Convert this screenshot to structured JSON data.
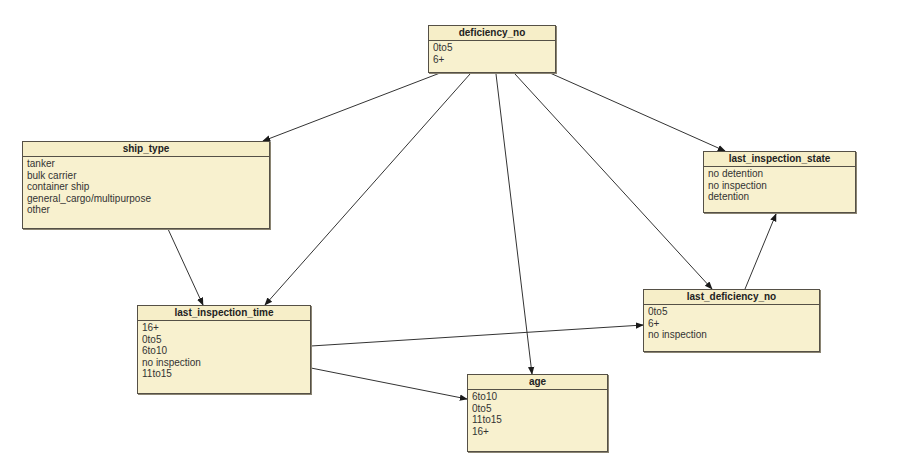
{
  "diagram": {
    "type": "bayesian-network",
    "nodes": [
      {
        "id": "deficiency_no",
        "label": "deficiency_no",
        "states": [
          "0to5",
          "6+"
        ],
        "box": {
          "x": 428,
          "y": 25,
          "w": 128,
          "h": 48
        }
      },
      {
        "id": "ship_type",
        "label": "ship_type",
        "states": [
          "tanker",
          "bulk carrier",
          "container ship",
          "general_cargo/multipurpose",
          "other"
        ],
        "box": {
          "x": 22,
          "y": 141,
          "w": 248,
          "h": 88
        }
      },
      {
        "id": "last_inspection_state",
        "label": "last_inspection_state",
        "states": [
          "no detention",
          "no inspection",
          "detention"
        ],
        "box": {
          "x": 703,
          "y": 151,
          "w": 153,
          "h": 62
        }
      },
      {
        "id": "last_inspection_time",
        "label": "last_inspection_time",
        "states": [
          "16+",
          "0to5",
          "6to10",
          "no inspection",
          "11to15"
        ],
        "box": {
          "x": 137,
          "y": 305,
          "w": 174,
          "h": 89
        }
      },
      {
        "id": "last_deficiency_no",
        "label": "last_deficiency_no",
        "states": [
          "0to5",
          "6+",
          "no inspection"
        ],
        "box": {
          "x": 643,
          "y": 289,
          "w": 177,
          "h": 63
        }
      },
      {
        "id": "age",
        "label": "age",
        "states": [
          "6to10",
          "0to5",
          "11to15",
          "16+"
        ],
        "box": {
          "x": 467,
          "y": 374,
          "w": 141,
          "h": 78
        }
      }
    ],
    "edges": [
      {
        "from": "deficiency_no",
        "to": "ship_type"
      },
      {
        "from": "deficiency_no",
        "to": "last_inspection_time"
      },
      {
        "from": "deficiency_no",
        "to": "age"
      },
      {
        "from": "deficiency_no",
        "to": "last_deficiency_no"
      },
      {
        "from": "deficiency_no",
        "to": "last_inspection_state"
      },
      {
        "from": "ship_type",
        "to": "last_inspection_time"
      },
      {
        "from": "last_inspection_time",
        "to": "last_deficiency_no"
      },
      {
        "from": "last_inspection_time",
        "to": "age"
      },
      {
        "from": "last_deficiency_no",
        "to": "last_inspection_state"
      }
    ]
  },
  "colors": {
    "node_fill": "#f8f1cf",
    "node_border": "#555046",
    "edge": "#333333"
  }
}
